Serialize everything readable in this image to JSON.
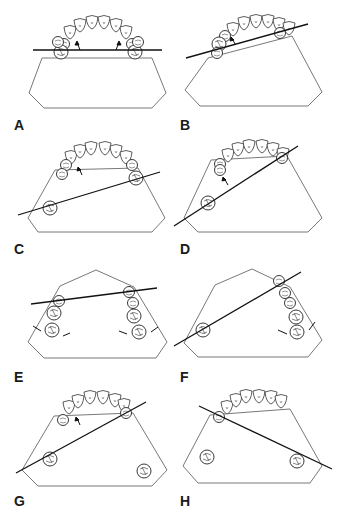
{
  "figure": {
    "panels": [
      {
        "id": "A",
        "label": "A"
      },
      {
        "id": "B",
        "label": "B"
      },
      {
        "id": "C",
        "label": "C"
      },
      {
        "id": "D",
        "label": "D"
      },
      {
        "id": "E",
        "label": "E"
      },
      {
        "id": "F",
        "label": "F"
      },
      {
        "id": "G",
        "label": "G"
      },
      {
        "id": "H",
        "label": "H"
      }
    ],
    "colors": {
      "line": "#111111",
      "outline": "#555555",
      "background": "#ffffff"
    }
  }
}
